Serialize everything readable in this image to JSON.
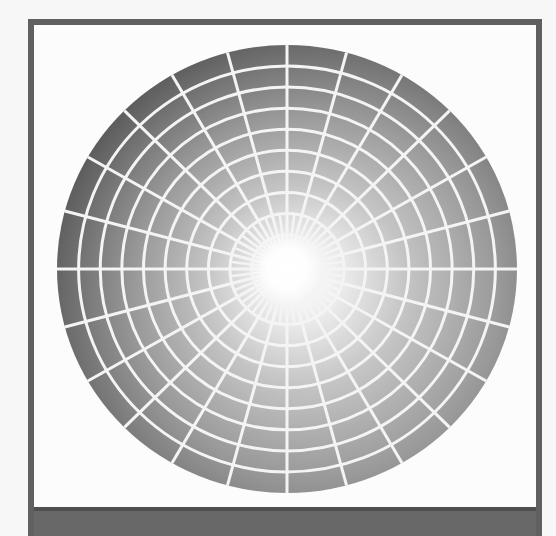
{
  "figure": {
    "colors": {
      "background": "#f7f7f7",
      "frame_border": "#606060",
      "frame_fill": "#fcfcfc",
      "bottom_bar": "#686868",
      "grid_lines": "#f4f4f4",
      "gradient_light": "#ffffff",
      "gradient_mid": "#9a9a9a",
      "gradient_dark": "#1c1c1c"
    },
    "wheel": {
      "center_x": 287,
      "center_y": 269,
      "radius_x": 230,
      "radius_y": 224,
      "ring_count": 10,
      "main_spoke_count": 24,
      "inner_extra_spoke_count": 24,
      "inner_extra_spoke_extent": 0.25,
      "highlight_center_x": 0.62,
      "highlight_center_y": 0.62
    }
  }
}
